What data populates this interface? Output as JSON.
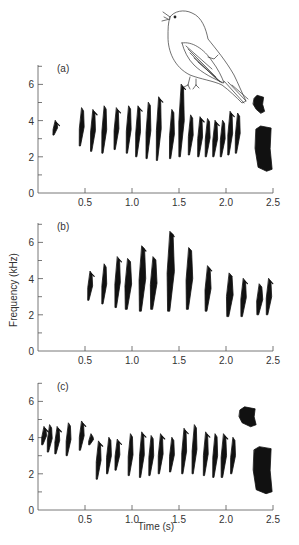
{
  "chart_data": [
    {
      "type": "spectrogram",
      "panel": "(a)",
      "xlabel": "",
      "ylabel": "",
      "xlim": [
        0,
        2.5
      ],
      "ylim": [
        0,
        7
      ],
      "xticks": [
        "0.5",
        "1.0",
        "1.5",
        "2.0",
        "2.5"
      ],
      "yticks": [
        "0",
        "2",
        "4",
        "6"
      ],
      "description": "Song with repeated chirps ~3.5–4.5 kHz from 0.15 s to ~2.15 s, ending in a broadband buzz at ~2.3–2.5 s (2–5 kHz)",
      "syllables": [
        {
          "t": 0.18,
          "f_low": 3.2,
          "f_high": 4.0,
          "w": 0.02
        },
        {
          "t": 0.46,
          "f_low": 2.6,
          "f_high": 4.7,
          "w": 0.03
        },
        {
          "t": 0.58,
          "f_low": 2.3,
          "f_high": 4.6,
          "w": 0.03
        },
        {
          "t": 0.7,
          "f_low": 2.2,
          "f_high": 4.8,
          "w": 0.03
        },
        {
          "t": 0.83,
          "f_low": 2.4,
          "f_high": 4.7,
          "w": 0.03
        },
        {
          "t": 0.96,
          "f_low": 2.2,
          "f_high": 4.8,
          "w": 0.03
        },
        {
          "t": 1.06,
          "f_low": 2.0,
          "f_high": 4.8,
          "w": 0.03
        },
        {
          "t": 1.17,
          "f_low": 1.9,
          "f_high": 5.0,
          "w": 0.03
        },
        {
          "t": 1.28,
          "f_low": 1.8,
          "f_high": 5.3,
          "w": 0.03
        },
        {
          "t": 1.42,
          "f_low": 1.9,
          "f_high": 4.6,
          "w": 0.03
        },
        {
          "t": 1.52,
          "f_low": 2.0,
          "f_high": 6.0,
          "w": 0.04
        },
        {
          "t": 1.62,
          "f_low": 2.1,
          "f_high": 4.3,
          "w": 0.03
        },
        {
          "t": 1.72,
          "f_low": 2.0,
          "f_high": 4.2,
          "w": 0.03
        },
        {
          "t": 1.8,
          "f_low": 2.0,
          "f_high": 4.1,
          "w": 0.03
        },
        {
          "t": 1.88,
          "f_low": 2.0,
          "f_high": 4.0,
          "w": 0.03
        },
        {
          "t": 1.96,
          "f_low": 2.0,
          "f_high": 4.0,
          "w": 0.03
        },
        {
          "t": 2.04,
          "f_low": 2.1,
          "f_high": 4.5,
          "w": 0.03
        },
        {
          "t": 2.12,
          "f_low": 2.2,
          "f_high": 4.4,
          "w": 0.03
        }
      ],
      "terminal": [
        {
          "t0": 2.3,
          "t1": 2.4,
          "f_low": 4.4,
          "f_high": 5.4
        },
        {
          "t0": 2.32,
          "t1": 2.48,
          "f_low": 1.2,
          "f_high": 3.7
        }
      ]
    },
    {
      "type": "spectrogram",
      "panel": "(b)",
      "xlabel": "",
      "ylabel": "Frequency (kHz)",
      "xlim": [
        0,
        2.5
      ],
      "ylim": [
        0,
        7
      ],
      "xticks": [
        "0.5",
        "1.0",
        "1.5",
        "2.0",
        "2.5"
      ],
      "yticks": [
        "0",
        "2",
        "4",
        "6"
      ],
      "description": "Song of descending broadband syllables from ~0.55 s to ~2.45 s, peaking ~6.5 kHz at 1.4 s",
      "syllables": [
        {
          "t": 0.55,
          "f_low": 2.8,
          "f_high": 4.4,
          "w": 0.03
        },
        {
          "t": 0.7,
          "f_low": 2.6,
          "f_high": 4.8,
          "w": 0.03
        },
        {
          "t": 0.84,
          "f_low": 2.4,
          "f_high": 5.2,
          "w": 0.04
        },
        {
          "t": 0.95,
          "f_low": 2.3,
          "f_high": 5.1,
          "w": 0.06
        },
        {
          "t": 1.1,
          "f_low": 2.2,
          "f_high": 5.8,
          "w": 0.06
        },
        {
          "t": 1.22,
          "f_low": 2.3,
          "f_high": 5.2,
          "w": 0.06
        },
        {
          "t": 1.4,
          "f_low": 2.2,
          "f_high": 6.6,
          "w": 0.07
        },
        {
          "t": 1.6,
          "f_low": 2.3,
          "f_high": 5.7,
          "w": 0.06
        },
        {
          "t": 1.8,
          "f_low": 2.2,
          "f_high": 4.7,
          "w": 0.05
        },
        {
          "t": 2.03,
          "f_low": 1.9,
          "f_high": 4.3,
          "w": 0.06
        },
        {
          "t": 2.18,
          "f_low": 1.9,
          "f_high": 4.0,
          "w": 0.04
        },
        {
          "t": 2.35,
          "f_low": 2.0,
          "f_high": 3.7,
          "w": 0.05
        },
        {
          "t": 2.45,
          "f_low": 2.0,
          "f_high": 4.0,
          "w": 0.04
        }
      ],
      "terminal": []
    },
    {
      "type": "spectrogram",
      "panel": "(c)",
      "xlabel": "Time (s)",
      "ylabel": "",
      "xlim": [
        0,
        2.5
      ],
      "ylim": [
        0,
        7
      ],
      "xticks": [
        "0.5",
        "1.0",
        "1.5",
        "2.0",
        "2.5"
      ],
      "yticks": [
        "0",
        "2",
        "4",
        "6"
      ],
      "description": "Song starting with high chirps (4–4.8 kHz) 0.05–0.6 s, then dense syllables 2–4.5 kHz to 2.1 s, ending with broadband block at 2.15–2.3 s (4.5–5.7 kHz) and buzz to 2.5 s",
      "syllables": [
        {
          "t": 0.06,
          "f_low": 3.6,
          "f_high": 4.6,
          "w": 0.03
        },
        {
          "t": 0.12,
          "f_low": 3.2,
          "f_high": 4.7,
          "w": 0.03
        },
        {
          "t": 0.2,
          "f_low": 3.1,
          "f_high": 4.6,
          "w": 0.03
        },
        {
          "t": 0.32,
          "f_low": 3.0,
          "f_high": 4.8,
          "w": 0.03
        },
        {
          "t": 0.46,
          "f_low": 3.3,
          "f_high": 4.9,
          "w": 0.03
        },
        {
          "t": 0.56,
          "f_low": 3.6,
          "f_high": 4.2,
          "w": 0.03
        },
        {
          "t": 0.64,
          "f_low": 1.7,
          "f_high": 3.8,
          "w": 0.03
        },
        {
          "t": 0.75,
          "f_low": 2.0,
          "f_high": 4.0,
          "w": 0.03
        },
        {
          "t": 0.84,
          "f_low": 2.2,
          "f_high": 3.9,
          "w": 0.03
        },
        {
          "t": 0.98,
          "f_low": 1.9,
          "f_high": 4.2,
          "w": 0.03
        },
        {
          "t": 1.1,
          "f_low": 1.8,
          "f_high": 4.3,
          "w": 0.03
        },
        {
          "t": 1.2,
          "f_low": 1.9,
          "f_high": 4.1,
          "w": 0.03
        },
        {
          "t": 1.3,
          "f_low": 2.0,
          "f_high": 4.2,
          "w": 0.03
        },
        {
          "t": 1.42,
          "f_low": 2.1,
          "f_high": 4.0,
          "w": 0.03
        },
        {
          "t": 1.55,
          "f_low": 2.0,
          "f_high": 4.5,
          "w": 0.03
        },
        {
          "t": 1.66,
          "f_low": 2.0,
          "f_high": 4.7,
          "w": 0.03
        },
        {
          "t": 1.78,
          "f_low": 1.9,
          "f_high": 4.3,
          "w": 0.03
        },
        {
          "t": 1.88,
          "f_low": 1.8,
          "f_high": 4.2,
          "w": 0.03
        },
        {
          "t": 1.97,
          "f_low": 1.8,
          "f_high": 4.2,
          "w": 0.04
        },
        {
          "t": 2.07,
          "f_low": 2.0,
          "f_high": 4.0,
          "w": 0.03
        }
      ],
      "terminal": [
        {
          "t0": 2.15,
          "t1": 2.31,
          "f_low": 4.6,
          "f_high": 5.7
        },
        {
          "t0": 2.3,
          "t1": 2.48,
          "f_low": 0.9,
          "f_high": 3.5
        }
      ]
    }
  ],
  "figure": {
    "y_axis_title": "Frequency (kHz)",
    "x_axis_title": "Time (s)",
    "panels": [
      "(a)",
      "(b)",
      "(c)"
    ],
    "illustration": "singing-bird"
  },
  "colors": {
    "ink": "#111111",
    "axis": "#555555",
    "text": "#333333",
    "background": "#ffffff"
  }
}
